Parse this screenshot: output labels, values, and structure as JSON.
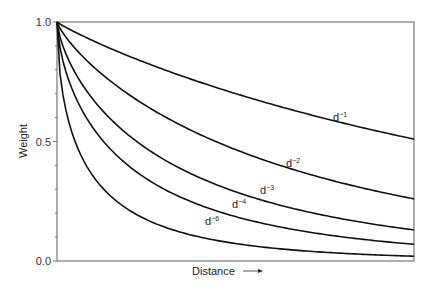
{
  "chart_data": {
    "type": "line",
    "title": "",
    "xlabel": "Distance",
    "ylabel": "Weight",
    "xlabel_arrow": true,
    "ylim": [
      0.0,
      1.0
    ],
    "yticks": [
      "0.0",
      "0.5",
      "1.0"
    ],
    "y_minor_tick_step": 0.1,
    "x_ticks": [],
    "grid": false,
    "legend": "inline labels",
    "series": [
      {
        "name": "d-1",
        "label_base": "d",
        "label_exp": "−1",
        "end_value": 0.51,
        "label_pos": [
          333,
          121
        ]
      },
      {
        "name": "d-2",
        "label_base": "d",
        "label_exp": "−2",
        "end_value": 0.26,
        "label_pos": [
          286,
          167
        ]
      },
      {
        "name": "d-3",
        "label_base": "d",
        "label_exp": "−3",
        "end_value": 0.13,
        "label_pos": [
          260,
          194
        ]
      },
      {
        "name": "d-4",
        "label_base": "d",
        "label_exp": "−4",
        "end_value": 0.07,
        "label_pos": [
          232,
          208
        ]
      },
      {
        "name": "d-6",
        "label_base": "d",
        "label_exp": "−6",
        "end_value": 0.02,
        "label_pos": [
          205,
          225
        ]
      }
    ]
  },
  "frame": {
    "left": 57,
    "top": 22,
    "right": 414,
    "bottom": 261
  }
}
